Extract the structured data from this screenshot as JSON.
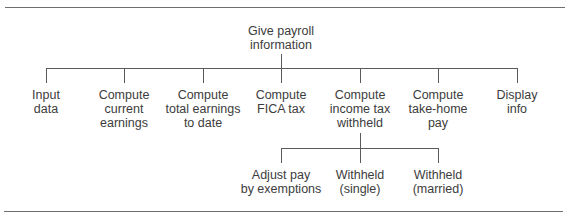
{
  "diagram": {
    "type": "hierarchy-chart",
    "root": {
      "label_lines": [
        "Give payroll",
        "information"
      ]
    },
    "level1": [
      {
        "id": "input-data",
        "label_lines": [
          "Input",
          "data"
        ]
      },
      {
        "id": "compute-current-earnings",
        "label_lines": [
          "Compute",
          "current",
          "earnings"
        ]
      },
      {
        "id": "compute-total-earnings",
        "label_lines": [
          "Compute",
          "total earnings",
          "to date"
        ]
      },
      {
        "id": "compute-fica-tax",
        "label_lines": [
          "Compute",
          "FICA tax"
        ]
      },
      {
        "id": "compute-income-tax-withheld",
        "label_lines": [
          "Compute",
          "income tax",
          "withheld"
        ]
      },
      {
        "id": "compute-take-home-pay",
        "label_lines": [
          "Compute",
          "take-home",
          "pay"
        ]
      },
      {
        "id": "display-info",
        "label_lines": [
          "Display",
          "info"
        ]
      }
    ],
    "level2_parent": "compute-income-tax-withheld",
    "level2": [
      {
        "id": "adjust-pay",
        "label_lines": [
          "Adjust pay",
          "by exemptions"
        ]
      },
      {
        "id": "withheld-single",
        "label_lines": [
          "Withheld",
          "(single)"
        ]
      },
      {
        "id": "withheld-married",
        "label_lines": [
          "Withheld",
          "(married)"
        ]
      }
    ],
    "colors": {
      "line": "#5a5a5a",
      "text": "#3c3c3c",
      "rule": "#6e6e6e",
      "background": "#ffffff"
    }
  }
}
